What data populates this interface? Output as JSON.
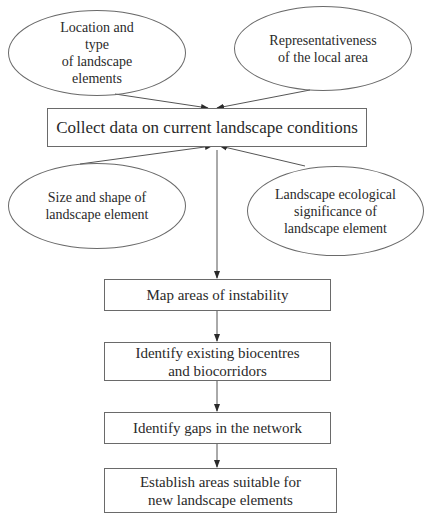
{
  "diagram": {
    "type": "flowchart",
    "inputs": [
      {
        "id": "location",
        "label": "Location and\ntype\nof landscape\nelements"
      },
      {
        "id": "representativeness",
        "label": "Representativeness\nof the local area"
      },
      {
        "id": "size",
        "label": "Size and shape of\nlandscape element"
      },
      {
        "id": "significance",
        "label": "Landscape ecological\nsignificance of\nlandscape element"
      }
    ],
    "steps": [
      {
        "id": "collect",
        "label": "Collect data on current landscape conditions"
      },
      {
        "id": "map",
        "label": "Map areas of instability"
      },
      {
        "id": "identify_bio",
        "label": "Identify existing biocentres\nand biocorridors"
      },
      {
        "id": "gaps",
        "label": "Identify gaps in the network"
      },
      {
        "id": "establish",
        "label": "Establish areas suitable for\nnew landscape elements"
      }
    ],
    "edges": [
      {
        "from": "location",
        "to": "collect"
      },
      {
        "from": "representativeness",
        "to": "collect"
      },
      {
        "from": "size",
        "to": "collect"
      },
      {
        "from": "significance",
        "to": "collect"
      },
      {
        "from": "collect",
        "to": "map"
      },
      {
        "from": "map",
        "to": "identify_bio"
      },
      {
        "from": "identify_bio",
        "to": "gaps"
      },
      {
        "from": "gaps",
        "to": "establish"
      }
    ],
    "colors": {
      "stroke": "#6a6a6a",
      "text": "#2a2a2a",
      "background": "#ffffff"
    }
  }
}
